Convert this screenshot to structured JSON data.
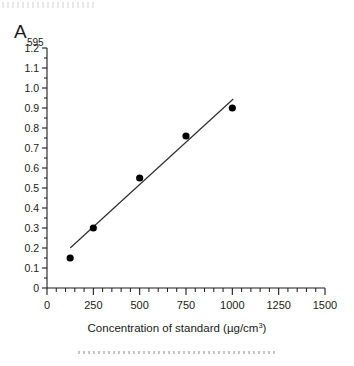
{
  "chart_data": {
    "type": "scatter",
    "title": "",
    "subtitle": "",
    "xlabel": "Concentration of standard (µg/cm³)",
    "xlabel_main": "Concentration of standard (µg/cm",
    "xlabel_sup": "3",
    "xlabel_tail": ")",
    "ylabel": "A595",
    "ylabel_main": "A",
    "ylabel_sub": "595",
    "xlim": [
      0,
      1500
    ],
    "ylim": [
      0,
      1.2
    ],
    "x_major_ticks": [
      0,
      250,
      500,
      750,
      1000,
      1250,
      1500
    ],
    "x_tick_labels": [
      "0",
      "250",
      "500",
      "750",
      "1000",
      "1250",
      "1500"
    ],
    "x_minor_interval": 50,
    "y_major_ticks": [
      0,
      0.1,
      0.2,
      0.3,
      0.4,
      0.5,
      0.6,
      0.7,
      0.8,
      0.9,
      1.0,
      1.1,
      1.2
    ],
    "y_tick_labels": [
      "0",
      "0.1",
      "0.2",
      "0.3",
      "0.4",
      "0.5",
      "0.6",
      "0.7",
      "0.8",
      "0.9",
      "1.0",
      "1.1",
      "1.2"
    ],
    "y_minor_interval": 0.05,
    "grid": false,
    "legend": null,
    "x": [
      125,
      250,
      500,
      750,
      1000
    ],
    "y": [
      0.15,
      0.3,
      0.55,
      0.76,
      0.9
    ],
    "points": [
      {
        "x": 125,
        "y": 0.15
      },
      {
        "x": 250,
        "y": 0.3
      },
      {
        "x": 500,
        "y": 0.55
      },
      {
        "x": 750,
        "y": 0.76
      },
      {
        "x": 1000,
        "y": 0.9
      }
    ],
    "series": [
      {
        "name": "Standard curve",
        "marker": "filled-circle",
        "marker_color": "#000000",
        "values": [
          0.15,
          0.3,
          0.55,
          0.76,
          0.9
        ]
      },
      {
        "name": "Line of best fit",
        "type": "line",
        "color": "#2b2b2b",
        "x_start": 125,
        "y_start": 0.2,
        "x_end": 1005,
        "y_end": 0.945
      }
    ],
    "annotations": []
  },
  "colors": {
    "background": "#ffffff",
    "axis": "#1a1a1a",
    "marker": "#000000",
    "fit_line": "#2b2b2b",
    "artifact": "#9096a5"
  },
  "artifacts": {
    "top_dotted_label": "scan-artifact-top",
    "bottom_dotted_label": "scan-artifact-bottom"
  }
}
